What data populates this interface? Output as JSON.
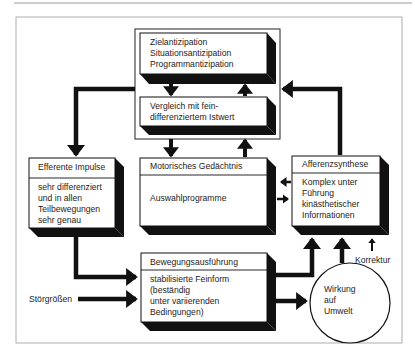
{
  "diagram": {
    "type": "flow-diagram",
    "language": "de",
    "nodes": {
      "anticipation": {
        "lines": [
          "Zielantizipation",
          "Situationsantizipation",
          "Programmantizipation"
        ]
      },
      "comparison": {
        "lines": [
          "Vergleich mit fein-",
          "differenziertem Istwert"
        ]
      },
      "efferent": {
        "title": "Efferente Impulse",
        "lines": [
          "sehr differenziert",
          "und in allen",
          "Teilbewegungen",
          "sehr genau"
        ]
      },
      "motor_memory": {
        "title": "Motorisches Gedächtnis",
        "lines": [
          "Auswahlprogramme"
        ]
      },
      "afferent_synthesis": {
        "title": "Afferenzsynthese",
        "lines": [
          "Komplex unter",
          "Führung",
          "kinästhetischer",
          "Informationen"
        ]
      },
      "execution": {
        "title": "Bewegungsausführung",
        "lines": [
          "stabilisierte Feinform",
          "(beständig",
          "unter variierenden",
          "Bedingungen)"
        ]
      },
      "effect": {
        "lines": [
          "Wirkung",
          "auf",
          "Umwelt"
        ]
      }
    },
    "labels": {
      "disturbances": "Störgrößen",
      "correction": "Korrektur"
    },
    "edges": [
      {
        "from": "anticipation",
        "to": "comparison"
      },
      {
        "from": "comparison",
        "to": "anticipation"
      },
      {
        "from": "comparison",
        "to": "motor_memory"
      },
      {
        "from": "motor_memory",
        "to": "comparison"
      },
      {
        "from": "anticipation_group",
        "to": "efferent"
      },
      {
        "from": "afferent_synthesis",
        "to": "anticipation_group"
      },
      {
        "from": "afferent_synthesis",
        "to": "motor_memory"
      },
      {
        "from": "motor_memory",
        "to": "afferent_synthesis"
      },
      {
        "from": "efferent",
        "to": "execution"
      },
      {
        "from": "disturbances",
        "to": "execution"
      },
      {
        "from": "execution",
        "to": "effect"
      },
      {
        "from": "execution",
        "to": "afferent_synthesis"
      },
      {
        "from": "effect",
        "to": "afferent_synthesis"
      },
      {
        "from": "correction",
        "to": "afferent_synthesis"
      }
    ],
    "colors": {
      "ink": "#111111",
      "frame": "#8a8a8a",
      "background": "#ffffff"
    }
  }
}
